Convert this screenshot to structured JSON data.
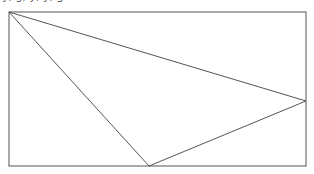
{
  "caption": {
    "text": "y, g, y, y, g",
    "note": "partially visible (clipped at top edge)"
  },
  "diagram": {
    "type": "geometric-figure",
    "shapes": [
      {
        "name": "bounding-rectangle",
        "kind": "rectangle"
      },
      {
        "name": "inscribed-triangle",
        "kind": "triangle",
        "vertices": [
          "rectangle top-left corner",
          "point on right side",
          "point on bottom side"
        ]
      }
    ],
    "stroke_color": "#555555",
    "background_color": "#ffffff"
  }
}
